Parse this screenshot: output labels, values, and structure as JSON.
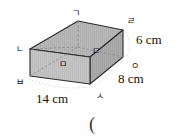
{
  "figure": {
    "kind": "rectangular-prism",
    "colors": {
      "top_face": "#b5b5b5",
      "front_face": "#c9c9c9",
      "right_face": "#a8a8a8",
      "edge": "#2b2b2b",
      "hidden_edge": "#8a8a8a",
      "text": "#111111"
    },
    "vertices": [
      {
        "id": "top-back-left",
        "label": "ㄱ",
        "x": 72,
        "y": 9
      },
      {
        "id": "top-front-left",
        "label": "ㄴ",
        "x": 16,
        "y": 45
      },
      {
        "id": "top-front-right",
        "label": "ㄷ",
        "x": 92,
        "y": 47
      },
      {
        "id": "top-back-right",
        "label": "ㄹ",
        "x": 127,
        "y": 17
      },
      {
        "id": "bottom-front-left-inner",
        "label": "ㅁ",
        "x": 59,
        "y": 60
      },
      {
        "id": "bottom-front-left",
        "label": "ㅂ",
        "x": 16,
        "y": 78
      },
      {
        "id": "bottom-front-right",
        "label": "ㅅ",
        "x": 96,
        "y": 92
      },
      {
        "id": "bottom-back-right",
        "label": "ㅇ",
        "x": 131,
        "y": 62
      }
    ],
    "dimensions": [
      {
        "id": "height",
        "label": "6 cm",
        "x": 136,
        "y": 33
      },
      {
        "id": "depth",
        "label": "8 cm",
        "x": 118,
        "y": 72
      },
      {
        "id": "width",
        "label": "14 cm",
        "x": 36,
        "y": 92
      }
    ]
  },
  "answer": {
    "open_paren": "("
  }
}
